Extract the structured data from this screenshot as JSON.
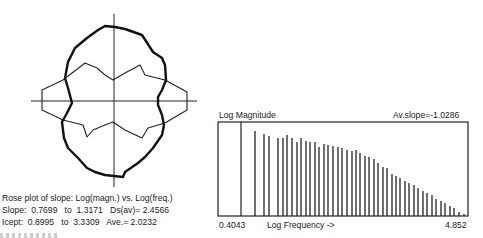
{
  "rose_plot": {
    "caption": "Rose plot of slope: Log(magn.) vs. Log(freq.)",
    "slope_line": "Slope:  0.7699   to  1.3171   Ds(av)= 2.4566",
    "icept_line": "Icept:  0.8995   to  3.3309   Ave.= 2.0232"
  },
  "spectrum": {
    "y_label": "Log Magnitude",
    "av_slope": "Av.slope=-1.0286",
    "x_min": "0.4043",
    "x_label": "Log Frequency ->",
    "x_max": "4.852"
  },
  "chart_data": [
    {
      "type": "rose",
      "title": "Rose plot of slope: Log(magn.) vs. Log(freq.)",
      "center": [
        114,
        101
      ],
      "series": [
        {
          "name": "slope (thick outline)",
          "points": [
            [
              105,
              26
            ],
            [
              115,
              27
            ],
            [
              125,
              29
            ],
            [
              142,
              35
            ],
            [
              153,
              52
            ],
            [
              162,
              58
            ],
            [
              165,
              65
            ],
            [
              166,
              80
            ],
            [
              162,
              90
            ],
            [
              158,
              97
            ],
            [
              158,
              105
            ],
            [
              162,
              115
            ],
            [
              164,
              125
            ],
            [
              162,
              135
            ],
            [
              153,
              148
            ],
            [
              145,
              157
            ],
            [
              138,
              163
            ],
            [
              125,
              172
            ],
            [
              123,
              177
            ],
            [
              105,
              175
            ],
            [
              95,
              172
            ],
            [
              87,
              168
            ],
            [
              78,
              158
            ],
            [
              68,
              148
            ],
            [
              64,
              138
            ],
            [
              62,
              122
            ],
            [
              67,
              113
            ],
            [
              72,
              103
            ],
            [
              68,
              88
            ],
            [
              65,
              78
            ],
            [
              68,
              62
            ],
            [
              75,
              48
            ],
            [
              87,
              38
            ],
            [
              98,
              30
            ]
          ]
        },
        {
          "name": "intercept (thin outline)",
          "points": [
            [
              42,
              90
            ],
            [
              63,
              80
            ],
            [
              85,
              63
            ],
            [
              97,
              68
            ],
            [
              105,
              75
            ],
            [
              113,
              80
            ],
            [
              125,
              73
            ],
            [
              140,
              65
            ],
            [
              145,
              75
            ],
            [
              165,
              80
            ],
            [
              187,
              92
            ],
            [
              187,
              110
            ],
            [
              165,
              123
            ],
            [
              148,
              128
            ],
            [
              142,
              138
            ],
            [
              125,
              130
            ],
            [
              113,
              122
            ],
            [
              105,
              125
            ],
            [
              93,
              130
            ],
            [
              87,
              137
            ],
            [
              83,
              125
            ],
            [
              63,
              120
            ],
            [
              42,
              110
            ]
          ]
        }
      ],
      "annotations": {
        "slope_min": 0.7699,
        "slope_max": 1.3171,
        "ds_av": 2.4566,
        "icept_min": 0.8995,
        "icept_max": 3.3309,
        "ave": 2.0232
      }
    },
    {
      "type": "bar",
      "title": "Log Magnitude spectrum",
      "xlabel": "Log Frequency ->",
      "ylabel": "Log Magnitude",
      "xlim": [
        0.4043,
        4.852
      ],
      "annotation": "Av.slope=-1.0286",
      "grid": false,
      "frame": {
        "left": 218,
        "top": 122,
        "right": 468,
        "bottom": 216,
        "marker_x": 241
      },
      "bars": [
        {
          "x": 255,
          "top": 131
        },
        {
          "x": 264,
          "top": 134
        },
        {
          "x": 269,
          "top": 136
        },
        {
          "x": 278,
          "top": 138
        },
        {
          "x": 283,
          "top": 138
        },
        {
          "x": 287,
          "top": 135
        },
        {
          "x": 292,
          "top": 138
        },
        {
          "x": 297,
          "top": 142
        },
        {
          "x": 301,
          "top": 138
        },
        {
          "x": 306,
          "top": 141
        },
        {
          "x": 310,
          "top": 142
        },
        {
          "x": 315,
          "top": 142
        },
        {
          "x": 319,
          "top": 147
        },
        {
          "x": 324,
          "top": 144
        },
        {
          "x": 328,
          "top": 145
        },
        {
          "x": 333,
          "top": 146
        },
        {
          "x": 338,
          "top": 147
        },
        {
          "x": 342,
          "top": 148
        },
        {
          "x": 347,
          "top": 150
        },
        {
          "x": 352,
          "top": 151
        },
        {
          "x": 356,
          "top": 150
        },
        {
          "x": 360,
          "top": 153
        },
        {
          "x": 365,
          "top": 156
        },
        {
          "x": 369,
          "top": 157
        },
        {
          "x": 374,
          "top": 159
        },
        {
          "x": 378,
          "top": 163
        },
        {
          "x": 383,
          "top": 167
        },
        {
          "x": 387,
          "top": 168
        },
        {
          "x": 392,
          "top": 174
        },
        {
          "x": 396,
          "top": 176
        },
        {
          "x": 400,
          "top": 178
        },
        {
          "x": 405,
          "top": 181
        },
        {
          "x": 409,
          "top": 183
        },
        {
          "x": 414,
          "top": 185
        },
        {
          "x": 418,
          "top": 188
        },
        {
          "x": 423,
          "top": 191
        },
        {
          "x": 427,
          "top": 193
        },
        {
          "x": 432,
          "top": 195
        },
        {
          "x": 436,
          "top": 199
        },
        {
          "x": 441,
          "top": 201
        },
        {
          "x": 445,
          "top": 203
        },
        {
          "x": 450,
          "top": 206
        },
        {
          "x": 454,
          "top": 208
        },
        {
          "x": 459,
          "top": 212
        },
        {
          "x": 464,
          "top": 214
        }
      ]
    }
  ]
}
